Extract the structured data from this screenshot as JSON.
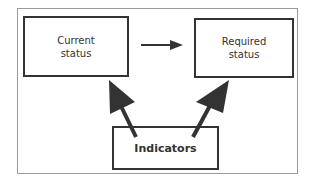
{
  "diagram": {
    "nodes": [
      {
        "id": "current",
        "label": "Current\nstatus"
      },
      {
        "id": "required",
        "label": "Required\nstatus"
      },
      {
        "id": "indicators",
        "label": "Indicators"
      }
    ],
    "edges": [
      {
        "from": "current",
        "to": "required"
      },
      {
        "from": "indicators",
        "to": "current"
      },
      {
        "from": "indicators",
        "to": "required"
      }
    ],
    "colors": {
      "stroke": "#333333",
      "frame": "#9a9a9a"
    }
  }
}
